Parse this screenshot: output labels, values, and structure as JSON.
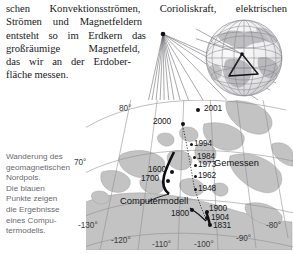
{
  "prose": {
    "lines": [
      "schen Konvektionsströmen, Corioliskraft, elektrischen",
      "Strömen und Magnetfeldern",
      "entsteht so im Erdkern das",
      "großräumige Magnetfeld,",
      "das wir an der Erdober-",
      "fläche messen."
    ],
    "l1_words": [
      "schen",
      "Konvektionsströmen,",
      "Corioliskraft,",
      "elektrischen"
    ],
    "l2_words": [
      "Strömen",
      "und",
      "Magnetfeldern"
    ],
    "l3_words": [
      "entsteht",
      "so",
      "im",
      "Erdkern",
      "das"
    ],
    "l4_words": [
      "großräumige",
      "Magnetfeld,"
    ],
    "l5_words": [
      "das",
      "wir",
      "an",
      "der",
      "Erdober-"
    ],
    "l6": "fläche messen."
  },
  "caption": {
    "lines": [
      "Wanderung des",
      "geomagnetischen",
      "Nordpols.",
      "Die blauen",
      "Punkte zeigen",
      "die Ergebnisse",
      "eines Compu-",
      "termodells."
    ],
    "full_text": "Wanderung des geomagnetischen Nordpols. Die blauen Punkte zeigen die Ergebnisse eines Computermodells."
  },
  "figure": {
    "globe_label": "earth-globe-inset",
    "cone_label": "magnifier-projection-cone"
  },
  "map": {
    "series_labels": {
      "measured": "Gemessen",
      "model": "Computermodell"
    },
    "measured_points": [
      {
        "year": "2001",
        "x": 110,
        "y": 8,
        "lx": 118,
        "ly": 4,
        "big": false
      },
      {
        "year": "2000",
        "x": 95,
        "y": 22,
        "lx": 67,
        "ly": 17,
        "big": true
      },
      {
        "year": "1994",
        "x": 104,
        "y": 43,
        "lx": 108,
        "ly": 38,
        "big": false
      },
      {
        "year": "1984",
        "x": 107,
        "y": 55,
        "lx": 111,
        "ly": 50,
        "big": false
      },
      {
        "year": "1973",
        "x": 108,
        "y": 62,
        "lx": 112,
        "ly": 58,
        "big": false
      },
      {
        "year": "1962",
        "x": 108,
        "y": 73,
        "lx": 112,
        "ly": 68,
        "big": false
      },
      {
        "year": "1948",
        "x": 108,
        "y": 86,
        "lx": 112,
        "ly": 81,
        "big": false
      },
      {
        "year": "1900",
        "x": 119,
        "y": 110,
        "lx": 122,
        "ly": 103,
        "big": true
      },
      {
        "year": "1904",
        "x": 119,
        "y": 115,
        "lx": 124,
        "ly": 111,
        "big": true
      },
      {
        "year": "1831",
        "x": 122,
        "y": 122,
        "lx": 126,
        "ly": 119,
        "big": true
      }
    ],
    "model_points": [
      {
        "year": "1600",
        "x": 80,
        "y": 70,
        "lx": 62,
        "ly": 65,
        "big": true
      },
      {
        "year": "1700",
        "x": 77,
        "y": 78,
        "lx": 55,
        "ly": 73,
        "big": true
      },
      {
        "year": "1800",
        "x": 104,
        "y": 108,
        "lx": 85,
        "ly": 108,
        "big": true
      }
    ],
    "latitude_ticks": [
      {
        "label": "80°",
        "x": 33,
        "y": 7
      },
      {
        "label": "70°",
        "x": -11,
        "y": 61
      }
    ],
    "longitude_ticks": [
      {
        "label": "-130°",
        "x": -8,
        "y": 122
      },
      {
        "label": "-120°",
        "x": 27,
        "y": 136
      },
      {
        "label": "-110°",
        "x": 68,
        "y": 140
      },
      {
        "label": "-100°",
        "x": 110,
        "y": 140
      },
      {
        "label": "-90°",
        "x": 150,
        "y": 134
      },
      {
        "label": "-80°",
        "x": 180,
        "y": 122
      }
    ]
  },
  "colors": {
    "land": "#c3c3c3",
    "sea": "#ffffff",
    "graticule": "#8e8e93",
    "point": "#111118",
    "text": "#17171a",
    "caption_text": "#6a6a70"
  }
}
